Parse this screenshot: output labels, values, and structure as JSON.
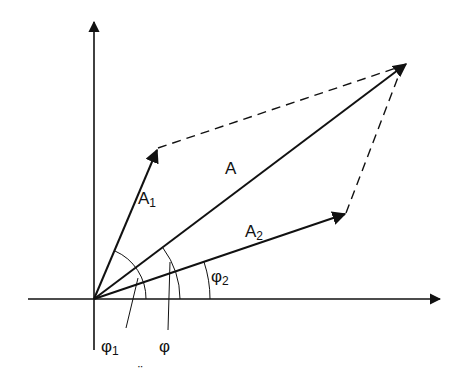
{
  "diagram": {
    "type": "phasor-vector-addition",
    "colors": {
      "stroke": "#111111",
      "background": "#ffffff"
    },
    "axes": {
      "origin": [
        94,
        299
      ],
      "x_end": [
        440,
        299
      ],
      "y_end": [
        94,
        22
      ]
    },
    "vectors": [
      {
        "name": "A1",
        "label": "A",
        "sub": "1",
        "from": [
          94,
          299
        ],
        "to": [
          158,
          148
        ]
      },
      {
        "name": "A2",
        "label": "A",
        "sub": "2",
        "from": [
          94,
          299
        ],
        "to": [
          346,
          213
        ]
      },
      {
        "name": "A",
        "label": "A",
        "sub": "",
        "from": [
          94,
          299
        ],
        "to": [
          407,
          63
        ]
      }
    ],
    "angles": [
      {
        "name": "phi1",
        "label": "φ",
        "sub": "1"
      },
      {
        "name": "phi",
        "label": "φ",
        "sub": ""
      },
      {
        "name": "phi2",
        "label": "φ",
        "sub": "2"
      }
    ],
    "artifact": "¨"
  }
}
